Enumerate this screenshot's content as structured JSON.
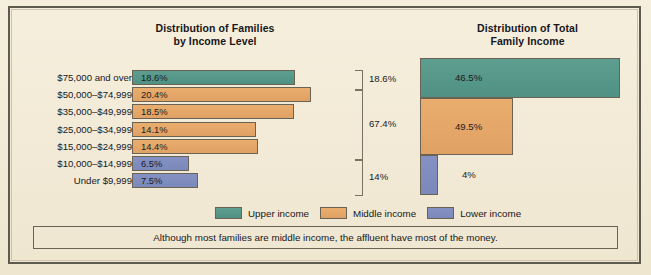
{
  "colors": {
    "upper": "#4f9184",
    "middle": "#e0a264",
    "lower": "#7b88bb",
    "background": "#f2ebd9",
    "frame": "#5f5a4e",
    "text": "#18171b"
  },
  "titles": {
    "left": "Distribution of Families\nby Income Level",
    "left_line1": "Distribution of Families",
    "left_line2": "by Income Level",
    "right_line1": "Distribution of Total",
    "right_line2": "Family Income"
  },
  "legend": {
    "items": [
      {
        "label": "Upper income",
        "color": "#4f9184",
        "key": "upper"
      },
      {
        "label": "Middle income",
        "color": "#e0a264",
        "key": "middle"
      },
      {
        "label": "Lower income",
        "color": "#7b88bb",
        "key": "lower"
      }
    ]
  },
  "caption": {
    "text": "Although most families are middle income, the affluent have most of the money."
  },
  "brackets": [
    {
      "label": "18.6%",
      "group": "upper"
    },
    {
      "label": "67.4%",
      "group": "middle"
    },
    {
      "label": "14%",
      "group": "lower"
    }
  ],
  "chart_data": [
    {
      "type": "bar",
      "orientation": "horizontal",
      "title": "Distribution of Families by Income Level",
      "xlabel": "",
      "ylabel": "",
      "categories": [
        "$75,000 and over",
        "$50,000–$74,999",
        "$35,000–$49,999",
        "$25,000–$34,999",
        "$15,000–$24,999",
        "$10,000–$14,999",
        "Under $9,999"
      ],
      "values": [
        18.6,
        20.4,
        18.5,
        14.1,
        14.4,
        6.5,
        7.5
      ],
      "value_labels": [
        "18.6%",
        "20.4%",
        "18.5%",
        "14.1%",
        "14.4%",
        "6.5%",
        "7.5%"
      ],
      "bar_colors": [
        "upper",
        "middle",
        "middle",
        "middle",
        "middle",
        "lower",
        "lower"
      ],
      "xlim": [
        0,
        22
      ],
      "grid": false,
      "legend_position": "bottom-center",
      "annotations": [
        {
          "text": "18.6%",
          "covers": [
            "$75,000 and over"
          ]
        },
        {
          "text": "67.4%",
          "covers": [
            "$50,000–$74,999",
            "$35,000–$49,999",
            "$25,000–$34,999",
            "$15,000–$24,999"
          ]
        },
        {
          "text": "14%",
          "covers": [
            "$10,000–$14,999",
            "Under $9,999"
          ]
        }
      ]
    },
    {
      "type": "bar",
      "orientation": "horizontal",
      "title": "Distribution of Total Family Income",
      "xlabel": "",
      "ylabel": "",
      "categories": [
        "Upper income",
        "Middle income",
        "Lower income"
      ],
      "values": [
        46.5,
        49.5,
        4.0
      ],
      "value_labels": [
        "46.5%",
        "49.5%",
        "4%"
      ],
      "bar_colors": [
        "upper",
        "middle",
        "lower"
      ],
      "note": "Bar area is proportional to share; widths 46.5%, 49.5%, 4% of plot width",
      "xlim": [
        0,
        100
      ],
      "grid": false
    }
  ],
  "rows": [
    {
      "label": "$75,000 and over",
      "value": "18.6%",
      "width": 163,
      "color": "teal"
    },
    {
      "label": "$50,000–$74,999",
      "value": "20.4%",
      "width": 179,
      "color": "orange"
    },
    {
      "label": "$35,000–$49,999",
      "value": "18.5%",
      "width": 162,
      "color": "orange"
    },
    {
      "label": "$25,000–$34,999",
      "value": "14.1%",
      "width": 124,
      "color": "orange"
    },
    {
      "label": "$15,000–$24,999",
      "value": "14.4%",
      "width": 126,
      "color": "orange"
    },
    {
      "label": "$10,000–$14,999",
      "value": "6.5%",
      "width": 57,
      "color": "blue"
    },
    {
      "label": "Under $9,999",
      "value": "7.5%",
      "width": 66,
      "color": "blue"
    }
  ],
  "right_bars": [
    {
      "label": "46.5%",
      "color": "teal",
      "width": 200,
      "height": 40
    },
    {
      "label": "49.5%",
      "color": "orange",
      "width": 93,
      "height": 57
    },
    {
      "label": "4%",
      "color": "blue",
      "width": 18,
      "height": 40
    }
  ]
}
